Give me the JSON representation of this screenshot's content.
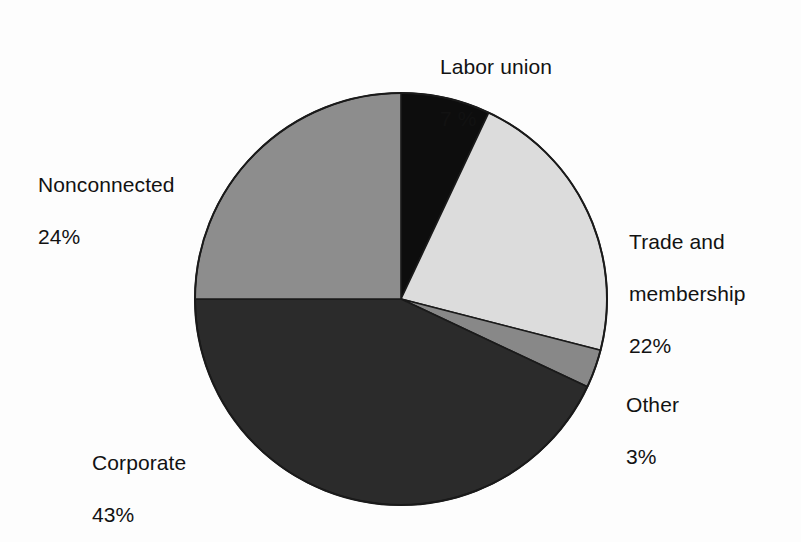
{
  "chart_data": {
    "type": "pie",
    "title": "",
    "subtitle": "",
    "xlabel": "",
    "ylabel": "",
    "legend_position": "none",
    "grid": false,
    "units": "percent",
    "total": 99,
    "start_angle_deg": 0,
    "direction": "clockwise",
    "categories": [
      "Labor union",
      "Trade and membership",
      "Other",
      "Corporate",
      "Nonconnected"
    ],
    "values": [
      7,
      22,
      3,
      43,
      24
    ],
    "value_labels": [
      "7 %",
      "22%",
      "3%",
      "43%",
      "24%"
    ],
    "colors": [
      "#0d0d0d",
      "#dcdcdc",
      "#888888",
      "#2b2b2b",
      "#8d8d8d"
    ],
    "slices": [
      {
        "name": "Labor union",
        "name_display": "Labor union",
        "value": 7,
        "value_label": "7 %",
        "color": "#0d0d0d",
        "start_deg": 0,
        "end_deg": 25.2
      },
      {
        "name": "Trade and membership",
        "name_display": "Trade and\nmembership",
        "value": 22,
        "value_label": "22%",
        "color": "#dcdcdc",
        "start_deg": 25.2,
        "end_deg": 104.4
      },
      {
        "name": "Other",
        "name_display": "Other",
        "value": 3,
        "value_label": "3%",
        "color": "#888888",
        "start_deg": 104.4,
        "end_deg": 115.2
      },
      {
        "name": "Corporate",
        "name_display": "Corporate",
        "value": 43,
        "value_label": "43%",
        "color": "#2b2b2b",
        "start_deg": 115.2,
        "end_deg": 270.0
      },
      {
        "name": "Nonconnected",
        "name_display": "Nonconnected",
        "value": 24,
        "value_label": "24%",
        "color": "#8d8d8d",
        "start_deg": 270.0,
        "end_deg": 360.0
      }
    ],
    "geometry": {
      "center_x": 401,
      "center_y": 299,
      "radius": 206,
      "outline_color": "#1a1a1a",
      "outline_width": 2
    }
  },
  "labels": {
    "labor_union": {
      "name": "Labor union",
      "value": "7 %"
    },
    "trade": {
      "name_line1": "Trade and",
      "name_line2": "membership",
      "value": "22%"
    },
    "other": {
      "name": "Other",
      "value": "3%"
    },
    "corporate": {
      "name": "Corporate",
      "value": "43%"
    },
    "nonconnected": {
      "name": "Nonconnected",
      "value": "24%"
    }
  },
  "page": {
    "background_color": "#fdfdfd",
    "text_color": "#121212"
  }
}
